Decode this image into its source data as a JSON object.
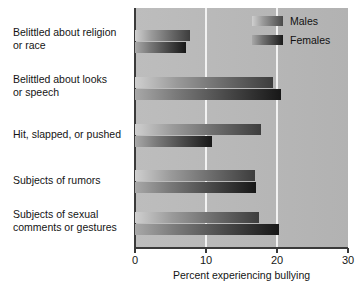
{
  "chart_data": {
    "type": "bar",
    "orientation": "horizontal",
    "title": "",
    "xlabel": "Percent experiencing bullying",
    "ylabel": "",
    "xlim": [
      0,
      30
    ],
    "xticks": [
      0,
      10,
      20,
      30
    ],
    "xtick_labels": [
      "0",
      "10",
      "20",
      "30"
    ],
    "gridlines": [
      10,
      20
    ],
    "grid": true,
    "legend_position": "top-right",
    "categories": [
      "Belittled about religion or race",
      "Belittled about looks or speech",
      "Hit, slapped, or pushed",
      "Subjects of rumors",
      "Subjects of sexual comments or gestures"
    ],
    "category_lines": [
      [
        "Belittled about religion",
        "or race"
      ],
      [
        "Belittled about looks",
        "or speech"
      ],
      [
        "Hit, slapped, or pushed"
      ],
      [
        "Subjects of rumors"
      ],
      [
        "Subjects of sexual",
        "comments or gestures"
      ]
    ],
    "series": [
      {
        "name": "Males",
        "color": "#6a6a6a",
        "values": [
          7.8,
          19.4,
          17.8,
          16.9,
          17.5
        ]
      },
      {
        "name": "Females",
        "color": "#2a2a2a",
        "values": [
          7.2,
          20.6,
          10.9,
          17.1,
          20.3
        ]
      }
    ]
  },
  "legend": {
    "items": [
      {
        "label": "Males"
      },
      {
        "label": "Females"
      }
    ]
  },
  "axis": {
    "x_title": "Percent experiencing bullying",
    "tick_0": "0",
    "tick_1": "10",
    "tick_2": "20",
    "tick_3": "30"
  },
  "categories": {
    "c0_l0": "Belittled about religion",
    "c0_l1": "or race",
    "c1_l0": "Belittled about looks",
    "c1_l1": "or speech",
    "c2_l0": "Hit, slapped, or pushed",
    "c3_l0": "Subjects of rumors",
    "c4_l0": "Subjects of sexual",
    "c4_l1": "comments or gestures"
  },
  "colors": {
    "plot_background": "#b9b9b9",
    "gridline": "#f2f2f2",
    "axis": "#3a3a3a",
    "males_bar": "#6a6a6a",
    "females_bar": "#2a2a2a",
    "page_background": "#ffffff"
  }
}
